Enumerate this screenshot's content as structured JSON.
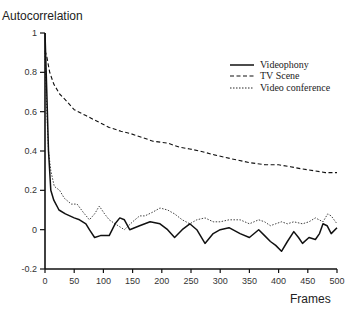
{
  "chart_data": {
    "type": "line",
    "title": "",
    "ylabel": "Autocorrelation",
    "xlabel": "Frames",
    "xlim": [
      0,
      500
    ],
    "ylim": [
      -0.2,
      1
    ],
    "x_ticks": [
      0,
      50,
      100,
      150,
      200,
      250,
      300,
      350,
      400,
      450,
      500
    ],
    "y_ticks": [
      -0.2,
      0,
      0.2,
      0.4,
      0.6,
      0.8,
      1
    ],
    "y_tick_labels": [
      "-0.2",
      "0",
      "0.2",
      "0.4",
      "0.6",
      "0.8",
      "1"
    ],
    "grid": false,
    "legend_position": "upper right",
    "series": [
      {
        "name": "Videophony",
        "style": "solid",
        "x": [
          0,
          3,
          6,
          10,
          15,
          24,
          35,
          50,
          59,
          70,
          76,
          85,
          95,
          110,
          120,
          128,
          136,
          145,
          162,
          180,
          197,
          210,
          222,
          235,
          248,
          260,
          274,
          288,
          300,
          315,
          334,
          350,
          366,
          376,
          386,
          395,
          405,
          415,
          426,
          434,
          441,
          452,
          463,
          470,
          476,
          483,
          490,
          500
        ],
        "values": [
          1.0,
          0.7,
          0.4,
          0.2,
          0.15,
          0.1,
          0.08,
          0.06,
          0.05,
          0.03,
          0.0,
          -0.04,
          -0.03,
          -0.03,
          0.03,
          0.06,
          0.05,
          0.0,
          0.02,
          0.04,
          0.03,
          0.0,
          -0.04,
          0.0,
          0.03,
          0.0,
          -0.07,
          -0.02,
          0.0,
          0.01,
          -0.02,
          -0.04,
          0.0,
          -0.03,
          -0.06,
          -0.08,
          -0.11,
          -0.06,
          -0.01,
          -0.04,
          -0.07,
          -0.04,
          -0.05,
          -0.02,
          0.03,
          0.02,
          -0.02,
          0.01
        ]
      },
      {
        "name": "TV Scene",
        "style": "dashed",
        "x": [
          0,
          3,
          8,
          15,
          25,
          35,
          50,
          70,
          90,
          110,
          130,
          145,
          165,
          185,
          210,
          230,
          248,
          265,
          290,
          320,
          352,
          378,
          400,
          420,
          438,
          460,
          480,
          500
        ],
        "values": [
          0.91,
          0.88,
          0.8,
          0.74,
          0.69,
          0.66,
          0.61,
          0.58,
          0.55,
          0.52,
          0.5,
          0.49,
          0.47,
          0.45,
          0.44,
          0.42,
          0.41,
          0.4,
          0.38,
          0.36,
          0.34,
          0.33,
          0.33,
          0.32,
          0.31,
          0.3,
          0.29,
          0.29
        ]
      },
      {
        "name": "Video conference",
        "style": "dotted",
        "x": [
          0,
          3,
          6,
          10,
          16,
          25,
          33,
          45,
          55,
          65,
          76,
          85,
          93,
          102,
          110,
          120,
          136,
          150,
          162,
          171,
          185,
          197,
          210,
          222,
          235,
          248,
          260,
          274,
          288,
          300,
          315,
          334,
          350,
          366,
          376,
          386,
          395,
          405,
          415,
          426,
          441,
          452,
          463,
          476,
          484,
          490,
          500
        ],
        "values": [
          0.9,
          0.6,
          0.4,
          0.3,
          0.22,
          0.2,
          0.16,
          0.13,
          0.13,
          0.09,
          0.05,
          0.08,
          0.12,
          0.08,
          0.05,
          0.03,
          0.0,
          0.04,
          0.07,
          0.07,
          0.09,
          0.11,
          0.1,
          0.08,
          0.05,
          0.03,
          0.05,
          0.06,
          0.04,
          0.04,
          0.05,
          0.05,
          0.03,
          0.05,
          0.04,
          0.02,
          0.03,
          0.04,
          0.03,
          0.04,
          0.03,
          0.04,
          0.06,
          0.04,
          0.08,
          0.07,
          0.03
        ]
      }
    ]
  },
  "legend": {
    "items": [
      {
        "label": "Videophony",
        "style": "solid"
      },
      {
        "label": "TV Scene",
        "style": "dashed"
      },
      {
        "label": "Video conference",
        "style": "dotted"
      }
    ]
  },
  "colors": {
    "line": "#111111",
    "background": "#ffffff"
  }
}
